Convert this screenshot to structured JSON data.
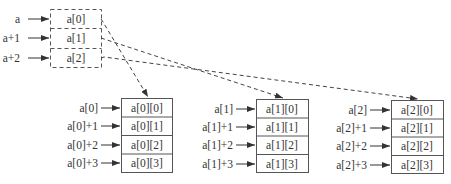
{
  "diagram": {
    "title": "",
    "type": "two-dimensional array memory layout",
    "colors": {
      "stroke": "#555555",
      "text": "#333333",
      "background": "#ffffff"
    },
    "pointer_array": {
      "style": "dashed",
      "pointers": [
        "a",
        "a+1",
        "a+2"
      ],
      "cells": [
        "a[0]",
        "a[1]",
        "a[2]"
      ]
    },
    "rows": [
      {
        "pointers": [
          "a[0]",
          "a[0]+1",
          "a[0]+2",
          "a[0]+3"
        ],
        "cells": [
          "a[0][0]",
          "a[0][1]",
          "a[0][2]",
          "a[0][3]"
        ]
      },
      {
        "pointers": [
          "a[1]",
          "a[1]+1",
          "a[1]+2",
          "a[1]+3"
        ],
        "cells": [
          "a[1][0]",
          "a[1][1]",
          "a[1][2]",
          "a[1][3]"
        ]
      },
      {
        "pointers": [
          "a[2]",
          "a[2]+1",
          "a[2]+2",
          "a[2]+3"
        ],
        "cells": [
          "a[2][0]",
          "a[2][1]",
          "a[2][2]",
          "a[2][3]"
        ]
      }
    ],
    "links": [
      {
        "from": "a[0]",
        "to": "a[0][0]",
        "style": "dashed-arrow"
      },
      {
        "from": "a[1]",
        "to": "a[1][0]",
        "style": "dashed-arrow"
      },
      {
        "from": "a[2]",
        "to": "a[2][0]",
        "style": "dashed-arrow"
      }
    ]
  }
}
